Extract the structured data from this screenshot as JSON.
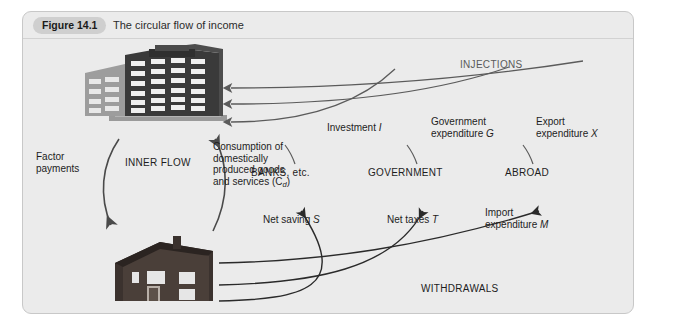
{
  "figure": {
    "number": "Figure 14.1",
    "title": "The circular flow of income"
  },
  "diagram": {
    "type": "circular-flow-of-income",
    "actors": {
      "firms": "firms-building-icon",
      "households": "households-house-icon"
    },
    "inner_flow": {
      "center_label": "INNER FLOW",
      "factor_payments": "Factor\npayments",
      "consumption": "Consumption of\ndomestically\nproduced goods\nand services (C",
      "consumption_subscript": "d",
      "consumption_tail": ")"
    },
    "injections": {
      "group_label": "INJECTIONS",
      "items": [
        {
          "label_line1": "Investment",
          "symbol": "I",
          "label_line2": ""
        },
        {
          "label_line1": "Government",
          "label_line2": "expenditure",
          "symbol": "G"
        },
        {
          "label_line1": "Export",
          "label_line2": "expenditure",
          "symbol": "X"
        }
      ]
    },
    "sectors": [
      {
        "name": "BANKS, etc."
      },
      {
        "name": "GOVERNMENT"
      },
      {
        "name": "ABROAD"
      }
    ],
    "withdrawals": {
      "group_label": "WITHDRAWALS",
      "items": [
        {
          "label_line1": "Net saving",
          "symbol": "S",
          "label_line2": ""
        },
        {
          "label_line1": "Net taxes",
          "symbol": "T",
          "label_line2": ""
        },
        {
          "label_line1": "Import",
          "label_line2": "expenditure",
          "symbol": "M"
        }
      ]
    }
  },
  "colors": {
    "panel_bg": "#ebebeb",
    "panel_border": "#c8c8c8",
    "pill_bg": "#cfcfcf",
    "text": "#1d1d1d",
    "injection_stroke": "#5b5b5b",
    "withdrawal_stroke": "#2a2a2a",
    "building_dark": "#3a3a3a",
    "house_dark": "#2e2a28"
  }
}
